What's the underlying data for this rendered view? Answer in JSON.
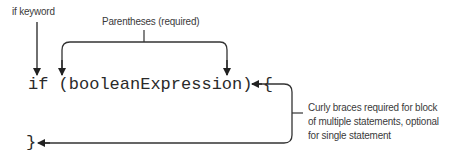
{
  "diagram": {
    "labels": {
      "if_keyword": "if keyword",
      "parentheses": "Parentheses (required)",
      "curly_braces": [
        "Curly braces required for block",
        "of multiple statements, optional",
        "for single statement"
      ]
    },
    "code": {
      "line1": "if (booleanExpression) {",
      "line2": "}"
    },
    "colors": {
      "line": "#333333",
      "text": "#3a3a3a",
      "background": "#ffffff"
    }
  }
}
